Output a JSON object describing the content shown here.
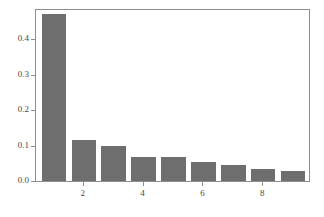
{
  "chart_data": {
    "type": "bar",
    "title": "",
    "subtitle": "",
    "xlabel": "",
    "ylabel": "",
    "categories": [
      "1",
      "2",
      "3",
      "4",
      "5",
      "6",
      "7",
      "8",
      "9"
    ],
    "values": [
      0.47,
      0.115,
      0.098,
      0.068,
      0.068,
      0.053,
      0.044,
      0.035,
      0.028
    ],
    "series": [
      {
        "name": "frequency",
        "values": [
          0.47,
          0.115,
          0.098,
          0.068,
          0.068,
          0.053,
          0.044,
          0.035,
          0.028
        ]
      }
    ],
    "xlim": [
      0.4,
      9.6
    ],
    "ylim": [
      0.0,
      0.4877
    ],
    "x_tick_values": [
      2,
      4,
      6,
      8
    ],
    "x_tick_labels": [
      "2",
      "4",
      "6",
      "8"
    ],
    "y_tick_values": [
      0.0,
      0.1,
      0.2,
      0.3,
      0.4
    ],
    "y_tick_labels": [
      "0.0",
      "0.1",
      "0.2",
      "0.3",
      "0.4"
    ],
    "grid": false,
    "legend": null,
    "legend_position": "none",
    "bar_color": "#6e6e6e",
    "bar_width_fraction": 0.82,
    "frame_color": "#8d8d8d",
    "background_color": "#ffffff",
    "annotations": []
  }
}
